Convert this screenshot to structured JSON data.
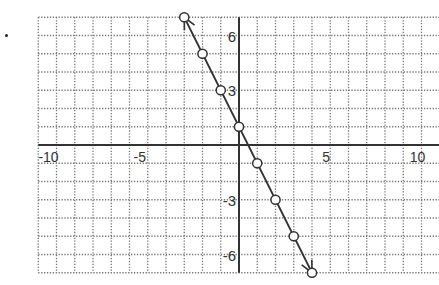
{
  "chart_data": {
    "type": "line",
    "title": "",
    "xlabel": "",
    "ylabel": "",
    "xlim": [
      -11,
      11
    ],
    "ylim": [
      -7,
      7
    ],
    "grid": true,
    "grid_style": "dotted",
    "grid_step": 1,
    "x_ticks": [
      -10,
      -5,
      5,
      10
    ],
    "x_tick_labels": [
      "-10",
      "-5",
      "5",
      "10"
    ],
    "y_ticks": [
      6,
      3,
      -3,
      -6
    ],
    "y_tick_labels": [
      "6",
      "3",
      "-3",
      "-6"
    ],
    "equation": "y = -2x + 1",
    "arrows_at_ends": true,
    "series": [
      {
        "name": "line",
        "x": [
          -3,
          -2,
          -1,
          0,
          1,
          2,
          3,
          4
        ],
        "y": [
          7,
          5,
          3,
          1,
          -1,
          -3,
          -5,
          -7
        ],
        "marker": "open-circle"
      }
    ],
    "colors": {
      "axis": "#333333",
      "grid": "#777777",
      "line": "#333333",
      "marker_fill": "#ffffff"
    }
  }
}
